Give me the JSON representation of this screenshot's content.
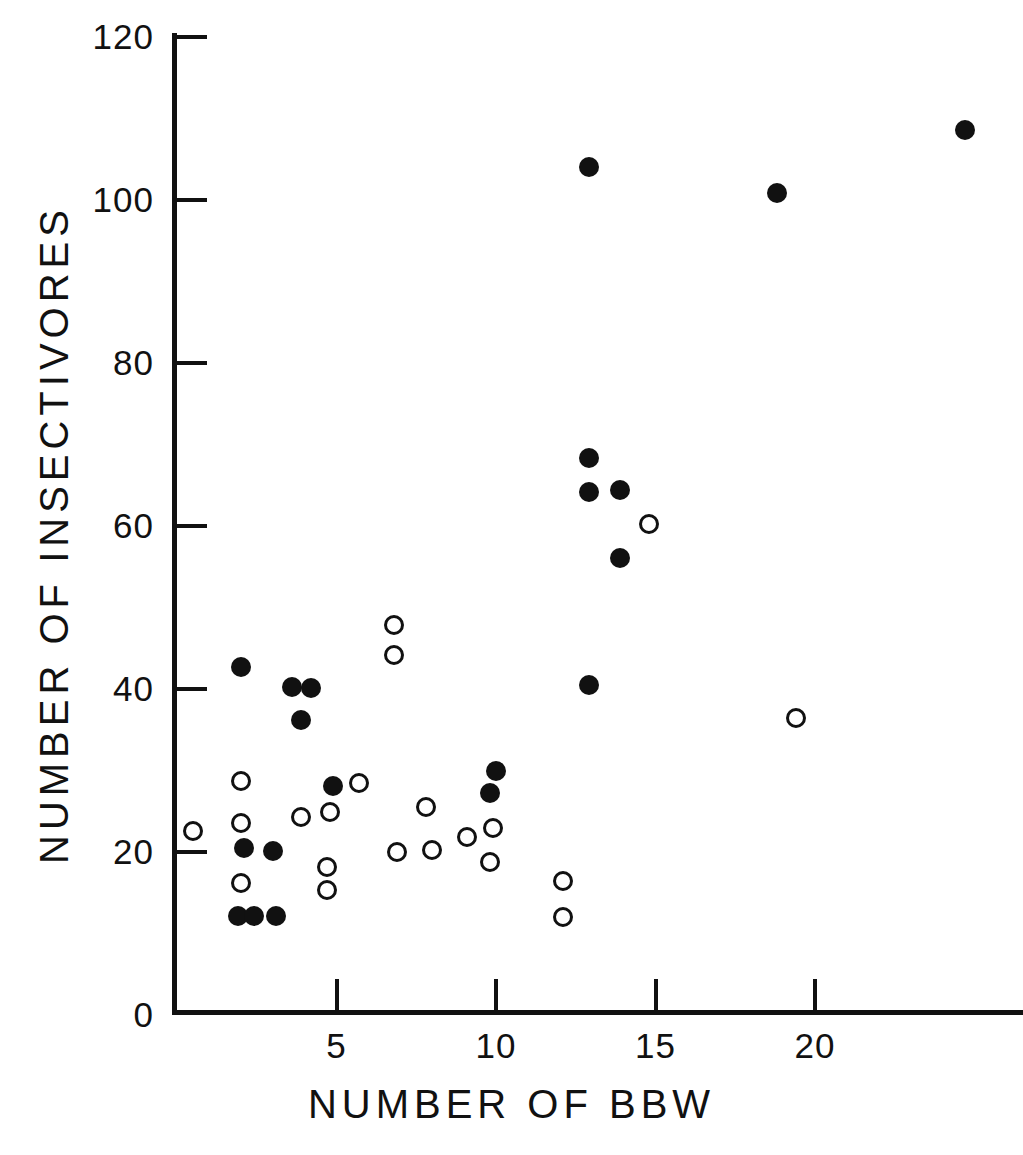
{
  "chart_data": {
    "type": "scatter",
    "title": "",
    "xlabel": "NUMBER OF BBW",
    "ylabel": "NUMBER OF INSECTIVORES",
    "xlim": [
      0,
      26.5
    ],
    "ylim": [
      0,
      120
    ],
    "xticks": [
      0,
      5,
      10,
      15,
      20
    ],
    "xticklabels": [
      "0",
      "5",
      "10",
      "15",
      "20"
    ],
    "yticks": [
      0,
      20,
      40,
      60,
      80,
      100,
      120
    ],
    "yticklabels": [
      "0",
      "20",
      "40",
      "60",
      "80",
      "100",
      "120"
    ],
    "grid": false,
    "legend": null,
    "marker_color": "#111111",
    "series": [
      {
        "name": "filled-circles",
        "marker": "filled-circle",
        "points": [
          [
            2.0,
            42.7
          ],
          [
            3.6,
            40.3
          ],
          [
            4.2,
            40.1
          ],
          [
            3.9,
            36.2
          ],
          [
            4.9,
            28.1
          ],
          [
            10.0,
            29.9
          ],
          [
            9.8,
            27.3
          ],
          [
            2.1,
            20.5
          ],
          [
            3.0,
            20.1
          ],
          [
            1.9,
            12.1
          ],
          [
            2.4,
            12.1
          ],
          [
            3.1,
            12.1
          ],
          [
            12.9,
            104.0
          ],
          [
            18.8,
            100.8
          ],
          [
            24.7,
            108.6
          ],
          [
            12.9,
            68.3
          ],
          [
            12.9,
            64.2
          ],
          [
            13.9,
            64.4
          ],
          [
            13.9,
            56.1
          ],
          [
            12.9,
            40.5
          ]
        ]
      },
      {
        "name": "open-circles",
        "marker": "open-circle",
        "points": [
          [
            0.5,
            22.6
          ],
          [
            2.0,
            28.7
          ],
          [
            2.0,
            23.6
          ],
          [
            2.0,
            16.2
          ],
          [
            3.9,
            24.3
          ],
          [
            4.8,
            24.9
          ],
          [
            4.7,
            18.1
          ],
          [
            4.7,
            15.3
          ],
          [
            5.7,
            28.5
          ],
          [
            6.8,
            47.9
          ],
          [
            6.8,
            44.2
          ],
          [
            7.8,
            25.5
          ],
          [
            6.9,
            20.0
          ],
          [
            8.0,
            20.2
          ],
          [
            9.1,
            21.9
          ],
          [
            9.9,
            22.9
          ],
          [
            9.8,
            18.8
          ],
          [
            12.1,
            16.4
          ],
          [
            12.1,
            12.0
          ],
          [
            14.8,
            60.2
          ],
          [
            19.4,
            36.5
          ]
        ]
      }
    ]
  },
  "axes_geometry": {
    "x_origin_px": 177,
    "y_origin_px": 1015,
    "x_scale_px_per_unit": 31.9,
    "y_scale_px_per_unit": 8.15
  }
}
